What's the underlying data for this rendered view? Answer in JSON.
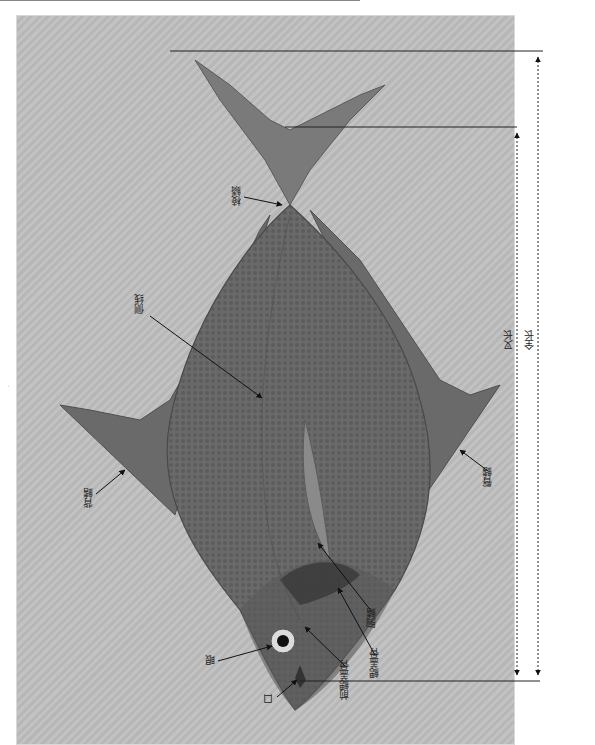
{
  "figure": {
    "orientation": "rotated 90deg, head at bottom, tail at top",
    "side_mark": "·",
    "labels": {
      "eye": "眼",
      "mouth": "口",
      "preopercle": "前鳃盖骨",
      "opercle": "鳃盖骨",
      "pectoral_fin": "胸鳍",
      "anal_fin": "臀鳍",
      "dorsal_fin": "背鳍",
      "lateral_line": "侧线",
      "keeled_scales": "棱鳞",
      "fork_length": "叉长",
      "total_length": "全长"
    },
    "colors": {
      "background": "#bdbdbd",
      "fish_body": "#6e6e6e",
      "fish_dark": "#4a4a4a",
      "lines": "#222222"
    }
  }
}
